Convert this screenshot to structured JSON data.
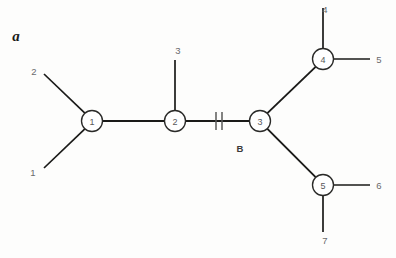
{
  "figure": {
    "panel_label": "a",
    "background_color": "#fdfdfc",
    "line_color": "#1a1a18",
    "node_fill_color": "#ffffff",
    "node_stroke_color": "#2a2a28",
    "label_color": "#6a6a6c"
  },
  "diagram": {
    "type": "node-link-tree",
    "internal_nodes": [
      {
        "id": "n1",
        "label": "1",
        "cx": 92,
        "cy": 121,
        "r": 10.5
      },
      {
        "id": "n2",
        "label": "2",
        "cx": 175,
        "cy": 121,
        "r": 10.5
      },
      {
        "id": "n3",
        "label": "3",
        "cx": 260,
        "cy": 121,
        "r": 10.5
      },
      {
        "id": "n4",
        "label": "4",
        "cx": 323,
        "cy": 59,
        "r": 10.5
      },
      {
        "id": "n5",
        "label": "5",
        "cx": 323,
        "cy": 185,
        "r": 10.5
      }
    ],
    "leaf_labels": [
      {
        "id": "l1",
        "label": "1",
        "x": 33,
        "y": 172
      },
      {
        "id": "l2",
        "label": "2",
        "x": 34,
        "y": 71
      },
      {
        "id": "l3",
        "label": "3",
        "x": 178,
        "y": 50
      },
      {
        "id": "l4",
        "label": "4",
        "x": 325,
        "y": 9
      },
      {
        "id": "l5",
        "label": "5",
        "x": 379,
        "y": 59
      },
      {
        "id": "l6",
        "label": "6",
        "x": 379,
        "y": 185
      },
      {
        "id": "l7",
        "label": "7",
        "x": 325,
        "y": 240
      }
    ],
    "internal_edges": [
      {
        "id": "e-n1-n2",
        "from": "n1",
        "to": "n2",
        "x1": 102.5,
        "y1": 121,
        "x2": 164.5,
        "y2": 121
      },
      {
        "id": "e-n2-n3",
        "from": "n2",
        "to": "n3",
        "x1": 185.5,
        "y1": 121,
        "x2": 249.5,
        "y2": 121
      },
      {
        "id": "e-n3-n4",
        "from": "n3",
        "to": "n4",
        "x1": 267.4,
        "y1": 113.1,
        "x2": 315.6,
        "y2": 66.9
      },
      {
        "id": "e-n3-n5",
        "from": "n3",
        "to": "n5",
        "x1": 267.4,
        "y1": 128.9,
        "x2": 315.6,
        "y2": 177.1
      }
    ],
    "leaf_edges": [
      {
        "id": "e-n1-l1",
        "from": "n1",
        "to": "l1",
        "x1": 84.9,
        "y1": 128.8,
        "x2": 44,
        "y2": 168
      },
      {
        "id": "e-n1-l2",
        "from": "n1",
        "to": "l2",
        "x1": 84.9,
        "y1": 113.2,
        "x2": 44,
        "y2": 74
      },
      {
        "id": "e-n2-l3",
        "from": "n2",
        "to": "l3",
        "x1": 175,
        "y1": 110.5,
        "x2": 175,
        "y2": 60
      },
      {
        "id": "e-n4-l4",
        "from": "n4",
        "to": "l4",
        "x1": 323,
        "y1": 48.5,
        "x2": 323,
        "y2": 8
      },
      {
        "id": "e-n4-l5",
        "from": "n4",
        "to": "l5",
        "x1": 333.5,
        "y1": 59,
        "x2": 370,
        "y2": 59
      },
      {
        "id": "e-n5-l6",
        "from": "n5",
        "to": "l6",
        "x1": 333.5,
        "y1": 185,
        "x2": 370,
        "y2": 185
      },
      {
        "id": "e-n5-l7",
        "from": "n5",
        "to": "l7",
        "x1": 323,
        "y1": 195.5,
        "x2": 323,
        "y2": 232
      }
    ],
    "branch_marker": {
      "id": "branch-b",
      "label": "B",
      "label_x": 240,
      "label_y": 148,
      "tick1_x": 216,
      "tick2_x": 222,
      "tick_y1": 112,
      "tick_y2": 130
    }
  }
}
